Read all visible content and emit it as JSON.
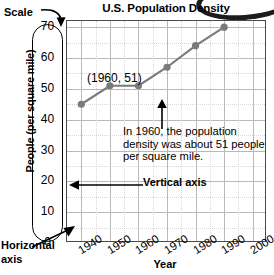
{
  "chart_data": {
    "type": "line",
    "title": "U.S. Population Density",
    "xlabel": "Year",
    "ylabel": "People (per square mile)",
    "x": [
      1940,
      1950,
      1960,
      1970,
      1980,
      1990
    ],
    "values": [
      45,
      51,
      51,
      57,
      64,
      70
    ],
    "xtick_labels": [
      "1940",
      "1950",
      "1960",
      "1970",
      "1980",
      "1990",
      "2000"
    ],
    "ytick_labels": [
      "70",
      "60",
      "50",
      "40",
      "30",
      "20",
      "10",
      "0"
    ],
    "xlim": [
      1935,
      2005
    ],
    "ylim": [
      0,
      72
    ],
    "grid": true,
    "legend": "none",
    "series_color": "#7a7a7a",
    "grid_color": "#b9b9b9",
    "annotations": [
      {
        "name": "point-label",
        "text": "(1960, 51)"
      },
      {
        "name": "callout",
        "text": "In 1960, the population density was about 51 people per square mile."
      },
      {
        "name": "vertical-axis",
        "text": "Vertical axis"
      },
      {
        "name": "horizontal-axis",
        "text": "Horizontal axis"
      },
      {
        "name": "scale",
        "text": "Scale"
      }
    ]
  },
  "callouts": {
    "scale": "Scale",
    "vertical_axis": "Vertical axis",
    "horizontal_axis_line1": "Horizontal",
    "horizontal_axis_line2": "axis",
    "point_label": "(1960, 51)",
    "note": "In 1960, the population density was about 51 people per square mile."
  }
}
